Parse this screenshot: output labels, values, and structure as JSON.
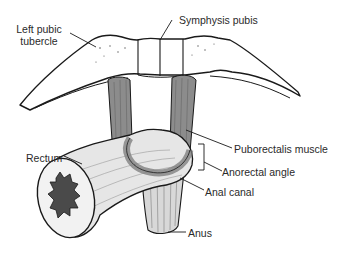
{
  "figure": {
    "labels": {
      "left_pubic_tubercle": "Left pubic tubercle",
      "left_pubic_tubercle_line1": "Left pubic",
      "left_pubic_tubercle_line2": "tubercle",
      "symphysis_pubis": "Symphysis pubis",
      "rectum": "Rectum",
      "puborectalis_muscle": "Puborectalis muscle",
      "anorectal_angle": "Anorectal angle",
      "anal_canal": "Anal canal",
      "anus": "Anus"
    },
    "colors": {
      "outline": "#1a1a1a",
      "muscle": "#8c8c8c",
      "muscle_light": "#bdbdbd",
      "rectum_fill": "#e6e6e6",
      "lumen": "#4a4a4a",
      "text": "#2a2a2a"
    }
  }
}
